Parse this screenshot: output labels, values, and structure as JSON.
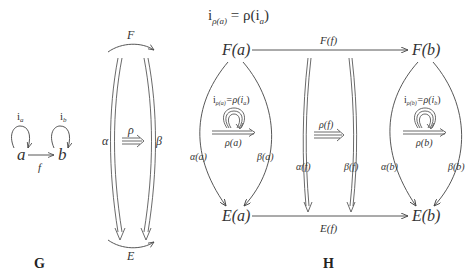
{
  "title": {
    "lhs": "i",
    "lhs_sub": "ρ(a)",
    "eq": " = ρ(i",
    "eq_sub": "a",
    "close": ")"
  },
  "panel_g": {
    "caption": "G",
    "nodes": {
      "a": "a",
      "b": "b"
    },
    "arrow_f": "f",
    "loop_a": {
      "base": "i",
      "sub": "a"
    },
    "loop_b": {
      "base": "i",
      "sub": "b"
    },
    "functor_top": "F",
    "functor_bottom": "E",
    "alpha": "α",
    "beta": "β",
    "rho": "ρ"
  },
  "panel_h": {
    "caption": "H",
    "nodes": {
      "Fa": "F(a)",
      "Fb": "F(b)",
      "Ea": "E(a)",
      "Eb": "E(b)"
    },
    "top_arrow": "F(f)",
    "bottom_arrow": "E(f)",
    "left": {
      "eq_base": "i",
      "eq_sub": "ρ(a)",
      "eq_rest": "=ρ(i",
      "eq_sub2": "a",
      "eq_close": ")",
      "rho": "ρ(a)",
      "alpha": "α(a)",
      "beta": "β(a)"
    },
    "middle": {
      "rho": "ρ(f)",
      "alpha": "α(f)",
      "beta": "β(f)"
    },
    "right": {
      "eq_base": "i",
      "eq_sub": "ρ(b)",
      "eq_rest": "=ρ(i",
      "eq_sub2": "b",
      "eq_close": ")",
      "rho": "ρ(b)",
      "alpha": "α(b)",
      "beta": "β(b)"
    }
  },
  "colors": {
    "ink": "#333333",
    "background": "#ffffff"
  }
}
